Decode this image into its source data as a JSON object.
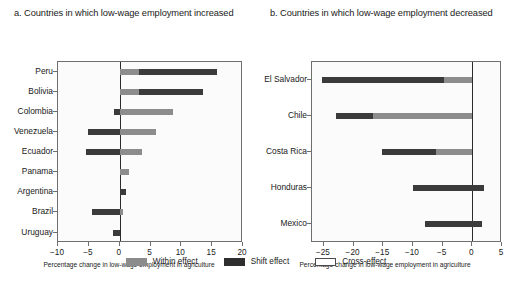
{
  "panels": [
    {
      "id": "a",
      "title": "a. Countries in which low-wage employment increased",
      "axis_title": "Percentage change in low-wage employment in agriculture",
      "xticks": [
        -10,
        -5,
        0,
        5,
        10,
        15,
        20
      ],
      "xtick_labels": [
        "−10",
        "−5",
        "0",
        "5",
        "10",
        "15",
        "20"
      ],
      "categories": [
        "Peru",
        "Bolivia",
        "Colombia",
        "Venezuela",
        "Ecuador",
        "Panama",
        "Argentina",
        "Brazil",
        "Uruguay"
      ]
    },
    {
      "id": "b",
      "title": "b. Countries in which low-wage employment decreased",
      "axis_title": "Percentage change in low-wage employment in agriculture",
      "xticks": [
        -25,
        -20,
        -15,
        -10,
        -5,
        0,
        5
      ],
      "xtick_labels": [
        "−25",
        "−20",
        "−15",
        "−10",
        "−5",
        "0",
        "5"
      ],
      "categories": [
        "El Salvador",
        "Chile",
        "Costa Rica",
        "Honduras",
        "Mexico"
      ]
    }
  ],
  "legend": {
    "items": [
      {
        "label": "Within effect",
        "key": "within",
        "color": "#8c8c8c"
      },
      {
        "label": "Shift effect",
        "key": "shift",
        "color": "#2e2e2e"
      },
      {
        "label": "Cross-effect",
        "key": "cross",
        "color": "#ffffff"
      }
    ]
  },
  "chart_data": {
    "type": "bar",
    "orientation": "horizontal",
    "stacked": true,
    "xlabel": "Percentage change in low-wage employment in agriculture",
    "ylabel": "",
    "grid": false,
    "legend_position": "bottom-center",
    "series": [
      {
        "name": "Within effect",
        "color": "#8c8c8c"
      },
      {
        "name": "Shift effect",
        "color": "#2e2e2e"
      },
      {
        "name": "Cross-effect",
        "color": "#ffffff"
      }
    ],
    "panels": [
      {
        "panel": "a",
        "panel_title": "a. Countries in which low-wage employment increased",
        "xlim": [
          -10,
          20
        ],
        "categories": [
          "Peru",
          "Bolivia",
          "Colombia",
          "Venezuela",
          "Ecuador",
          "Panama",
          "Argentina",
          "Brazil",
          "Uruguay"
        ],
        "bars": [
          {
            "category": "Peru",
            "segments": [
              {
                "effect": "within",
                "from": 0.0,
                "to": 3.1
              },
              {
                "effect": "shift",
                "from": 3.1,
                "to": 15.8
              }
            ],
            "total": 15.8
          },
          {
            "category": "Bolivia",
            "segments": [
              {
                "effect": "within",
                "from": 0.0,
                "to": 3.2
              },
              {
                "effect": "shift",
                "from": 3.2,
                "to": 13.5
              }
            ],
            "total": 13.5
          },
          {
            "category": "Colombia",
            "segments": [
              {
                "effect": "shift",
                "from": -1.0,
                "to": 0.0
              },
              {
                "effect": "within",
                "from": 0.0,
                "to": 8.6
              }
            ],
            "total": 7.6
          },
          {
            "category": "Venezuela",
            "segments": [
              {
                "effect": "shift",
                "from": -5.2,
                "to": 0.0
              },
              {
                "effect": "within",
                "from": 0.0,
                "to": 5.9
              }
            ],
            "total": 0.7
          },
          {
            "category": "Ecuador",
            "segments": [
              {
                "effect": "shift",
                "from": -5.5,
                "to": 0.0
              },
              {
                "effect": "within",
                "from": 0.0,
                "to": 3.7
              }
            ],
            "total": -1.8
          },
          {
            "category": "Panama",
            "segments": [
              {
                "effect": "within",
                "from": 0.0,
                "to": 1.5
              }
            ],
            "total": 1.5
          },
          {
            "category": "Argentina",
            "segments": [
              {
                "effect": "shift",
                "from": 0.0,
                "to": 1.0
              }
            ],
            "total": 1.0
          },
          {
            "category": "Brazil",
            "segments": [
              {
                "effect": "shift",
                "from": -4.5,
                "to": 0.0
              },
              {
                "effect": "within",
                "from": 0.0,
                "to": 0.5
              }
            ],
            "total": -4.0
          },
          {
            "category": "Uruguay",
            "segments": [
              {
                "effect": "shift",
                "from": -1.1,
                "to": 0.0
              }
            ],
            "total": -1.1
          }
        ]
      },
      {
        "panel": "b",
        "panel_title": "b. Countries in which low-wage employment decreased",
        "xlim": [
          -27,
          5
        ],
        "categories": [
          "El Salvador",
          "Chile",
          "Costa Rica",
          "Honduras",
          "Mexico"
        ],
        "bars": [
          {
            "category": "El Salvador",
            "segments": [
              {
                "effect": "shift",
                "from": -25.4,
                "to": -4.8
              },
              {
                "effect": "within",
                "from": -4.8,
                "to": 0.0
              }
            ],
            "total": -25.4
          },
          {
            "category": "Chile",
            "segments": [
              {
                "effect": "shift",
                "from": -23.0,
                "to": -16.7
              },
              {
                "effect": "within",
                "from": -16.7,
                "to": 0.0
              }
            ],
            "total": -23.0
          },
          {
            "category": "Costa Rica",
            "segments": [
              {
                "effect": "shift",
                "from": -15.2,
                "to": -6.2
              },
              {
                "effect": "within",
                "from": -6.2,
                "to": 0.0
              }
            ],
            "total": -15.2
          },
          {
            "category": "Honduras",
            "segments": [
              {
                "effect": "shift",
                "from": -10.0,
                "to": 2.0
              }
            ],
            "total": -10.0
          },
          {
            "category": "Mexico",
            "segments": [
              {
                "effect": "shift",
                "from": -8.0,
                "to": 1.6
              }
            ],
            "total": -8.0
          }
        ]
      }
    ]
  }
}
